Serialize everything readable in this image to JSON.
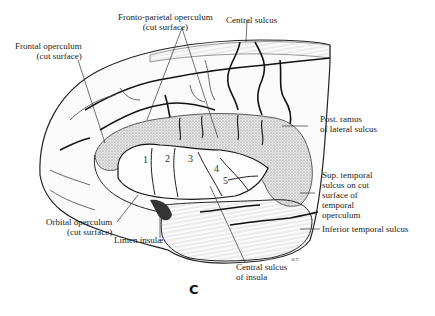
{
  "figure": {
    "panel_letter": "C",
    "signature": "W.Z.",
    "gyri_numbers": [
      "1",
      "2",
      "3",
      "4",
      "5"
    ],
    "labels": {
      "fronto_parietal_operculum": [
        "Fronto-parietal operculum",
        "(cut surface)"
      ],
      "central_sulcus": [
        "Central sulcus"
      ],
      "frontal_operculum": [
        "Frontal operculum",
        "(cut surface)"
      ],
      "post_ramus_lateral_sulcus": [
        "Post. ramus",
        "of lateral sulcus"
      ],
      "sup_temporal_sulcus": [
        "Sup. temporal",
        "sulcus on cut",
        "surface of",
        "temporal",
        "operculum"
      ],
      "inferior_temporal_sulcus": [
        "Inferior temporal sulcus"
      ],
      "orbital_operculum": [
        "Orbital operculum",
        "(cut surface)"
      ],
      "limen_insulae": [
        "Limen insulæ"
      ],
      "central_sulcus_insula": [
        "Central sulcus",
        "of insula"
      ]
    }
  }
}
